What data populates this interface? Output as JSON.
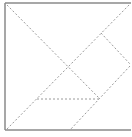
{
  "diagram": {
    "type": "tangram-square",
    "frame": {
      "x1": 5,
      "y1": 3,
      "x2": 131,
      "y2": 130,
      "stroke": "#8a8a8a",
      "stroke_width": 1.5
    },
    "dashed_lines": [
      {
        "id": "diag-tl-br",
        "x1": 7,
        "y1": 5,
        "x2": 100,
        "y2": 99
      },
      {
        "id": "diag-bl-tr",
        "x1": 7,
        "y1": 129,
        "x2": 130,
        "y2": 4
      },
      {
        "id": "upper-right-edge",
        "x1": 101,
        "y1": 33,
        "x2": 130,
        "y2": 64
      },
      {
        "id": "lower-right-edge",
        "x1": 130,
        "y1": 66,
        "x2": 70,
        "y2": 130
      },
      {
        "id": "horizontal-mid",
        "x1": 37,
        "y1": 99,
        "x2": 100,
        "y2": 99
      }
    ],
    "dash_color": "#9a9a9a",
    "caption": ""
  }
}
